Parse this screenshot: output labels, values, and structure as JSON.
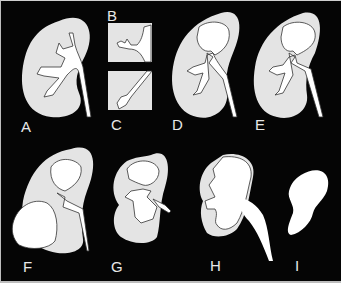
{
  "figure": {
    "background": "#050505",
    "parenchyma_color": "#e4e4e4",
    "collecting_system_color": "#ffffff",
    "outline_color": "#3a3a3a",
    "panels": [
      {
        "label": "A",
        "x": 20,
        "y": 118
      },
      {
        "label": "B",
        "x": 106,
        "y": 7
      },
      {
        "label": "C",
        "x": 110,
        "y": 116
      },
      {
        "label": "D",
        "x": 171,
        "y": 116
      },
      {
        "label": "E",
        "x": 254,
        "y": 116
      },
      {
        "label": "F",
        "x": 22,
        "y": 258
      },
      {
        "label": "G",
        "x": 110,
        "y": 258
      },
      {
        "label": "H",
        "x": 209,
        "y": 257
      },
      {
        "label": "I",
        "x": 294,
        "y": 257
      }
    ]
  }
}
